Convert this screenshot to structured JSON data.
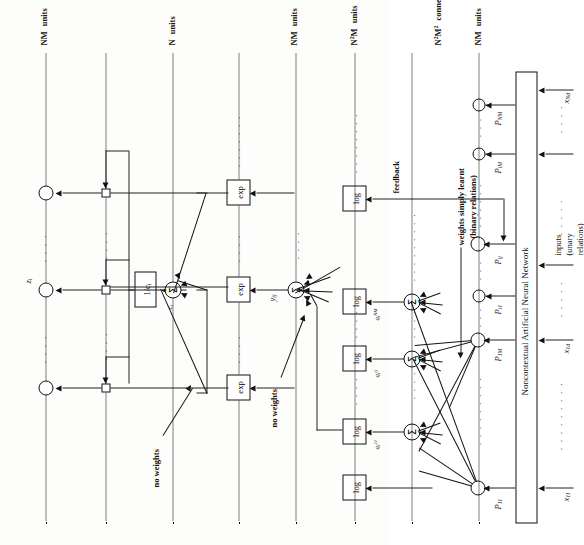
{
  "figure": {
    "base_box_label": "Noncontextual Artificial Neural Network"
  },
  "inputs": {
    "group_label_line1": "inputs",
    "group_label_line2": "(unary",
    "group_label_line3": "relations)",
    "labels": [
      "x11",
      "x1d",
      "xNd"
    ],
    "labels_rich": [
      "x₁₁",
      "x₁d",
      "xₙd"
    ]
  },
  "p_units": {
    "labels": [
      "P11",
      "P1M",
      "Pi1",
      "Pij",
      "PiM",
      "PNM"
    ]
  },
  "sigma_units": {
    "glyph": "Σ",
    "count_row1": 3,
    "count_row2": 1,
    "count_row3": 1
  },
  "q_labels": [
    "q21",
    "qij",
    "qNM"
  ],
  "y_label": "yij",
  "z_label": "zi",
  "c_label": "ci",
  "boxes": {
    "log_label": "log",
    "exp_label": "exp",
    "inverse_label": "1/ci"
  },
  "annotations": {
    "no_weights_upper": "no weights",
    "no_weights_lower": "no weights",
    "feedback": "feedback",
    "weights_learnt_line1": "weights simply learnt",
    "weights_learnt_line2": "(binary relations)"
  },
  "layer_labels": [
    {
      "id": "nm-units-top",
      "line1": "NM",
      "line2": "units"
    },
    {
      "id": "n-units",
      "line1": "N",
      "line2": "units"
    },
    {
      "id": "nm-units-mid",
      "line1": "NM",
      "line2": "units"
    },
    {
      "id": "n2m-units",
      "line1": "N2M",
      "line2": "units"
    },
    {
      "id": "n2m2-connections",
      "line1": "N2M2",
      "line2": "connections"
    },
    {
      "id": "nm-units-bottom",
      "line1": "NM",
      "line2": "units"
    }
  ],
  "ellipsis": "· · · ·"
}
